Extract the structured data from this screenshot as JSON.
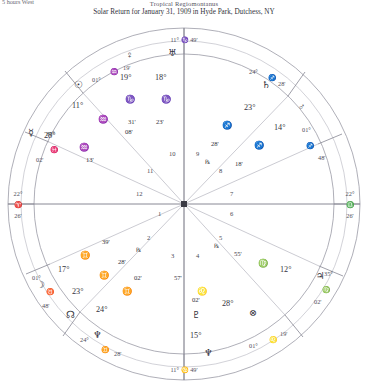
{
  "header": {
    "corner_note": "5 hours West",
    "system": "Tropical Regiomontanus",
    "title": "Solar Return for January 31, 1909 in Hyde Park, Dutchess, NY"
  },
  "glyphs": {
    "sun": "☉",
    "moon": "☽",
    "mercury": "☿",
    "venus": "♀",
    "mars": "♂",
    "jupiter": "♃",
    "saturn": "♄",
    "uranus": "♅",
    "neptune": "♆",
    "pluto": "♇",
    "node": "☊",
    "fortune": "⊗",
    "aries": "♈",
    "taurus": "♉",
    "gemini": "♊",
    "cancer": "♋",
    "leo": "♌",
    "virgo": "♍",
    "libra": "♎",
    "scorpio": "♏",
    "sagittarius": "♐",
    "capricorn": "♑",
    "aquarius": "♒",
    "pisces": "♓",
    "retrograde": "℞"
  },
  "angles": {
    "mc": {
      "deg": "11°",
      "sign": "♑",
      "min": "49'",
      "label": "11° ♑ 49'"
    },
    "ic": {
      "deg": "11°",
      "sign": "♋",
      "min": "49'",
      "label": "11° ♋ 49'"
    },
    "asc": {
      "deg": "22°",
      "sign": "♈",
      "min": "26'",
      "label": "22° ♈ 26'"
    },
    "dsc": {
      "deg": "22°",
      "sign": "♎",
      "min": "26'",
      "label": "22° ♎ 26'"
    }
  },
  "cusps": [
    {
      "house": "11",
      "deg": "01°",
      "sign": "♒",
      "min": "19'"
    },
    {
      "house": "12",
      "deg": "35°",
      "sign": "♓",
      "min": "02'"
    },
    {
      "house": "2",
      "deg": "01°",
      "sign": "♉",
      "min": "48'"
    },
    {
      "house": "3",
      "deg": "24°",
      "sign": "♊",
      "min": "28'"
    },
    {
      "house": "5",
      "deg": "01°",
      "sign": "♌",
      "min": "19'"
    },
    {
      "house": "6",
      "deg": "35°",
      "sign": "♍",
      "min": "02'"
    },
    {
      "house": "8",
      "deg": "01°",
      "sign": "♐",
      "min": "48'"
    },
    {
      "house": "9",
      "deg": "24°",
      "sign": "♐",
      "min": "28'"
    }
  ],
  "house_numbers": [
    "1",
    "2",
    "3",
    "4",
    "5",
    "6",
    "7",
    "8",
    "9",
    "10",
    "11",
    "12"
  ],
  "planets": [
    {
      "name": "sun",
      "glyph": "☉",
      "deg": "11°",
      "sign": "♒",
      "min": "08'",
      "retro": ""
    },
    {
      "name": "mercury",
      "glyph": "☿",
      "deg": "28°",
      "sign": "♒",
      "min": "13'",
      "retro": ""
    },
    {
      "name": "venus",
      "glyph": "♀",
      "deg": "19°",
      "sign": "♑",
      "min": "31'",
      "retro": ""
    },
    {
      "name": "uranus",
      "glyph": "♅",
      "deg": "18°",
      "sign": "♑",
      "min": "23'",
      "retro": ""
    },
    {
      "name": "saturn",
      "glyph": "♄",
      "deg": "23°",
      "sign": "♐",
      "min": "28'",
      "retro": "℞"
    },
    {
      "name": "mars",
      "glyph": "♂",
      "deg": "14°",
      "sign": "♐",
      "min": "18'",
      "retro": ""
    },
    {
      "name": "jupiter",
      "glyph": "♃",
      "deg": "12°",
      "sign": "♍",
      "min": "55'",
      "retro": "℞"
    },
    {
      "name": "fortune",
      "glyph": "⊗",
      "deg": "28°",
      "sign": "♌",
      "min": "57'",
      "retro": ""
    },
    {
      "name": "pluto",
      "glyph": "♇",
      "deg": "15°",
      "sign": "♋",
      "min": "02'",
      "retro": ""
    },
    {
      "name": "moon",
      "glyph": "☽",
      "deg": "17°",
      "sign": "♊",
      "min": "39'",
      "retro": ""
    },
    {
      "name": "mercury2",
      "glyph": "☿",
      "deg": "23°",
      "sign": "♊",
      "min": "28'",
      "retro": "℞"
    },
    {
      "name": "node",
      "glyph": "☊",
      "deg": "24°",
      "sign": "♊",
      "min": "02'",
      "retro": "℞"
    },
    {
      "name": "neptune",
      "glyph": "♆",
      "deg": "",
      "sign": "",
      "min": "",
      "retro": ""
    }
  ]
}
